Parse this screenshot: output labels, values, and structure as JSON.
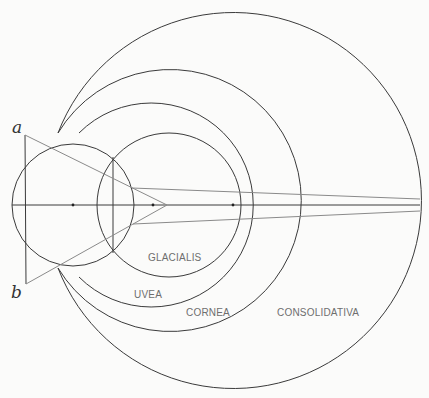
{
  "figure": {
    "labels": {
      "glacialis": "GLACIALIS",
      "uvea": "UVEA",
      "cornea": "CORNEA",
      "consolidativa": "CONSOLIDATIVA",
      "point_a": "a",
      "point_b": "b"
    },
    "colors": {
      "stroke": "#3a3a3a",
      "light_stroke": "#8a8a8a",
      "label": "#6e6e6e",
      "background": "#fbfbfa"
    }
  }
}
